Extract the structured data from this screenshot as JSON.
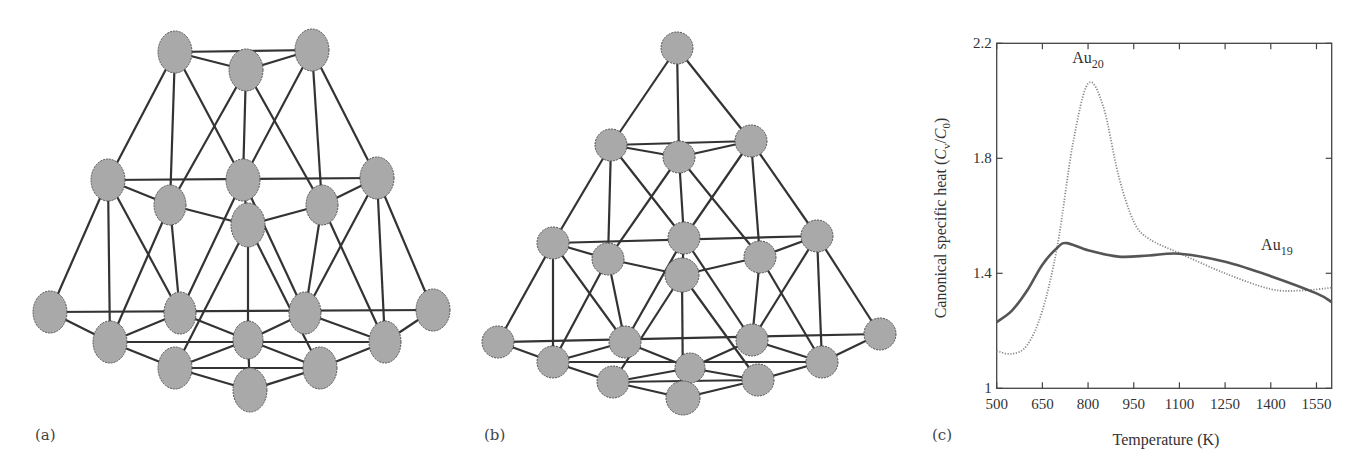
{
  "panels": {
    "a": {
      "label": "(a)",
      "description": "Au20 cluster ball-and-stick structure"
    },
    "b": {
      "label": "(b)",
      "description": "Au19 tetrahedral-like cluster ball-and-stick structure"
    },
    "c": {
      "label": "(c)"
    }
  },
  "colors": {
    "atom_fill": "#a9a9a9",
    "atom_stroke": "#555555",
    "bond": "#333333",
    "axis": "#444444",
    "au19_line": "#555555",
    "au20_line": "#888888"
  },
  "chart_data": {
    "type": "line",
    "title": "",
    "xlabel": "Temperature (K)",
    "ylabel": "Canonical specific heat (Cv/C0)",
    "xlim": [
      500,
      1600
    ],
    "ylim": [
      1.0,
      2.2
    ],
    "xticks": [
      500,
      650,
      800,
      950,
      1100,
      1250,
      1400,
      1550
    ],
    "yticks": [
      1,
      1.4,
      1.8,
      2.2
    ],
    "ytick_labels": [
      "1",
      "1.4",
      "1.8",
      "2.2"
    ],
    "grid": false,
    "series": [
      {
        "name": "Au20",
        "label": "Au",
        "subscript": "20",
        "style": "dotted",
        "x": [
          500,
          550,
          600,
          650,
          700,
          750,
          800,
          850,
          900,
          950,
          1000,
          1100,
          1250,
          1400,
          1500,
          1600
        ],
        "y": [
          1.13,
          1.12,
          1.15,
          1.27,
          1.5,
          1.85,
          2.06,
          1.98,
          1.74,
          1.58,
          1.52,
          1.47,
          1.4,
          1.345,
          1.34,
          1.35
        ]
      },
      {
        "name": "Au19",
        "label": "Au",
        "subscript": "19",
        "style": "solid",
        "x": [
          500,
          550,
          600,
          650,
          700,
          730,
          800,
          900,
          1000,
          1100,
          1250,
          1400,
          1550,
          1600
        ],
        "y": [
          1.23,
          1.27,
          1.34,
          1.43,
          1.49,
          1.505,
          1.48,
          1.458,
          1.462,
          1.468,
          1.44,
          1.39,
          1.33,
          1.3
        ]
      }
    ],
    "annotations": [
      {
        "text": "Au",
        "sub": "20",
        "x": 800,
        "y": 2.13
      },
      {
        "text": "Au",
        "sub": "19",
        "x": 1420,
        "y": 1.48
      }
    ]
  }
}
